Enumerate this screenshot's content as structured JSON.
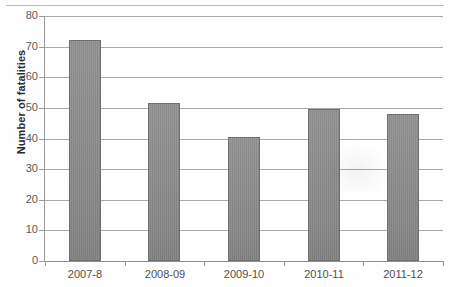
{
  "chart_data": {
    "type": "bar",
    "title": "",
    "subtitle": "",
    "xlabel": "",
    "ylabel": "Number of fatalities",
    "categories": [
      "2007-8",
      "2008-09",
      "2009-10",
      "2010-11",
      "2011-12"
    ],
    "values": [
      72,
      51.5,
      40.5,
      49.5,
      48
    ],
    "series": [
      {
        "name": "Number of fatalities",
        "values": [
          72,
          51.5,
          40.5,
          49.5,
          48
        ]
      }
    ],
    "ylim": [
      0,
      80
    ],
    "ytick_step": 10,
    "yticks": [
      "80",
      "70",
      "60",
      "50",
      "40",
      "30",
      "20",
      "10",
      "0"
    ],
    "ytick_values": [
      80,
      70,
      60,
      50,
      40,
      30,
      20,
      10,
      0
    ],
    "grid": "horizontal",
    "legend": "none",
    "bar_color": "#868686",
    "bar_border_color": "#6f6f6f",
    "gridline_color": "#a8a8a8",
    "axis_color": "#9a9a9a",
    "text_color": "#4f4f4f",
    "axis_title_color": "#2b2b2b",
    "background_color": "#ffffff"
  }
}
